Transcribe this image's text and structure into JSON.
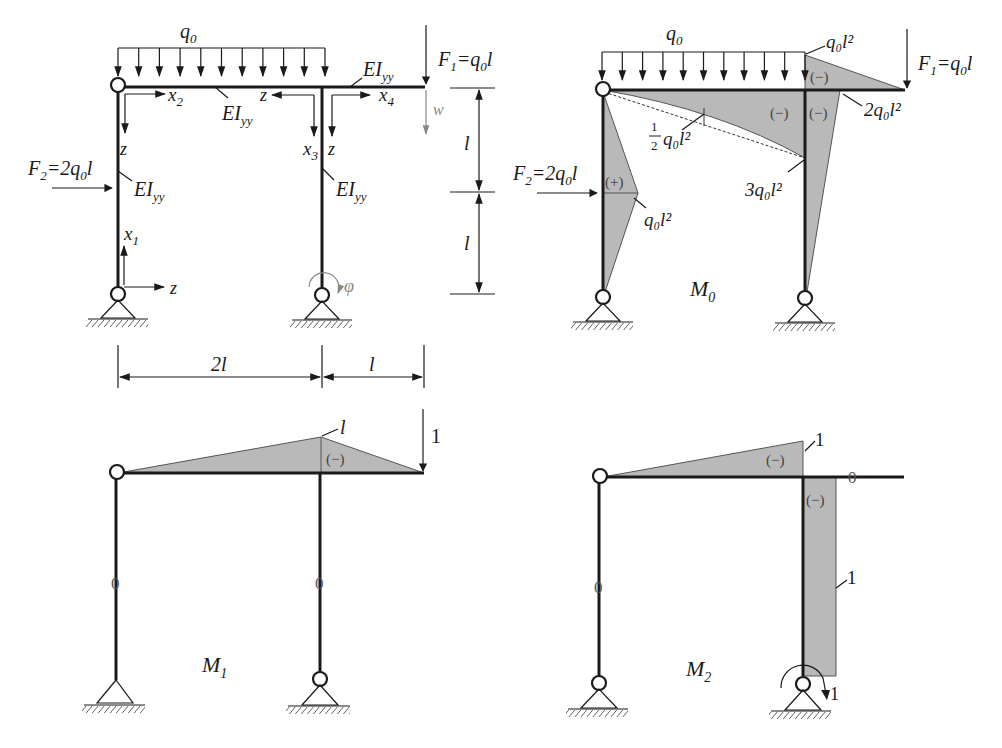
{
  "figure": {
    "panels": [
      {
        "id": "system",
        "labels": {
          "q0": "q",
          "q0_sub": "0",
          "F1": "F",
          "F1_sub": "1",
          "F1_eq": "=q",
          "F1_eq_sub": "0",
          "F1_tail": "l",
          "F2": "F",
          "F2_sub": "2",
          "F2_eq": "=2q",
          "F2_eq_sub": "0",
          "F2_tail": "l",
          "EI": "EI",
          "EI_sub": "yy",
          "x1": "x",
          "x1_sub": "1",
          "x2": "x",
          "x2_sub": "2",
          "x3": "x",
          "x3_sub": "3",
          "x4": "x",
          "x4_sub": "4",
          "z": "z",
          "w": "w",
          "phi": "φ",
          "dim_upper": "l",
          "dim_lower": "l",
          "dim_span_left": "2l",
          "dim_span_right": "l"
        }
      },
      {
        "id": "M0",
        "title": "M",
        "title_sub": "0",
        "labels": {
          "q0": "q",
          "q0_sub": "0",
          "F1": "F",
          "F1_sub": "1",
          "F1_eq": "=q",
          "F1_eq_sub": "0",
          "F1_tail": "l",
          "F2": "F",
          "F2_sub": "2",
          "F2_eq": "=2q",
          "F2_eq_sub": "0",
          "F2_tail": "l",
          "val_top": "q₀l²",
          "val_2": "2q₀l²",
          "val_half_frac_num": "1",
          "val_half_frac_den": "2",
          "val_half": "q₀l²",
          "val_3": "3q₀l²",
          "val_col": "q₀l²",
          "sign_neg": "(−)",
          "sign_pos": "(+)"
        }
      },
      {
        "id": "M1",
        "title": "M",
        "title_sub": "1",
        "labels": {
          "peak": "l",
          "unit_load": "1",
          "sign_neg": "(−)",
          "zero": "0"
        }
      },
      {
        "id": "M2",
        "title": "M",
        "title_sub": "2",
        "labels": {
          "peak": "1",
          "col": "1",
          "unit_moment": "1",
          "sign_neg": "(−)",
          "zero": "0"
        }
      }
    ]
  }
}
